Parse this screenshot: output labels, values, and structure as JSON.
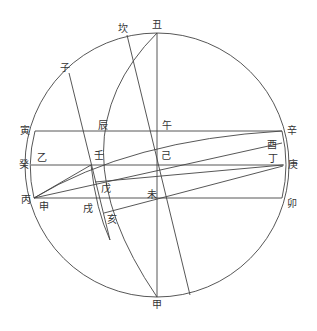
{
  "diagram": {
    "type": "geometric-construction",
    "circle": {
      "cx": 157,
      "cy": 165,
      "r": 132
    },
    "labels": [
      {
        "id": "chou",
        "text": "丑",
        "x": 152,
        "y": 20
      },
      {
        "id": "kan",
        "text": "坎",
        "x": 118,
        "y": 24
      },
      {
        "id": "zi",
        "text": "子",
        "x": 60,
        "y": 63
      },
      {
        "id": "yin",
        "text": "寅",
        "x": 20,
        "y": 126
      },
      {
        "id": "chen",
        "text": "辰",
        "x": 98,
        "y": 121
      },
      {
        "id": "wu",
        "text": "午",
        "x": 162,
        "y": 121
      },
      {
        "id": "xin",
        "text": "辛",
        "x": 287,
        "y": 126
      },
      {
        "id": "you",
        "text": "酉",
        "x": 267,
        "y": 140
      },
      {
        "id": "gui",
        "text": "癸",
        "x": 19,
        "y": 160
      },
      {
        "id": "yi2",
        "text": "乙",
        "x": 37,
        "y": 153
      },
      {
        "id": "ren",
        "text": "壬",
        "x": 94,
        "y": 151
      },
      {
        "id": "ji",
        "text": "己",
        "x": 161,
        "y": 151
      },
      {
        "id": "ding",
        "text": "丁",
        "x": 268,
        "y": 154
      },
      {
        "id": "geng",
        "text": "庚",
        "x": 288,
        "y": 160
      },
      {
        "id": "wu2",
        "text": "戊",
        "x": 101,
        "y": 184
      },
      {
        "id": "wei",
        "text": "未",
        "x": 147,
        "y": 190
      },
      {
        "id": "bing",
        "text": "丙",
        "x": 21,
        "y": 195
      },
      {
        "id": "shen",
        "text": "申",
        "x": 39,
        "y": 202
      },
      {
        "id": "xu",
        "text": "戌",
        "x": 83,
        "y": 204
      },
      {
        "id": "hai",
        "text": "亥",
        "x": 107,
        "y": 215
      },
      {
        "id": "mao",
        "text": "卯",
        "x": 287,
        "y": 199
      },
      {
        "id": "jia",
        "text": "甲",
        "x": 152,
        "y": 300
      }
    ]
  }
}
